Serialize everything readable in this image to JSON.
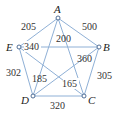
{
  "graph": {
    "nodes": [
      {
        "id": "A",
        "label": "A",
        "x": 58,
        "y": 18
      },
      {
        "id": "B",
        "label": "B",
        "x": 99,
        "y": 47
      },
      {
        "id": "C",
        "label": "C",
        "x": 84,
        "y": 96
      },
      {
        "id": "D",
        "label": "D",
        "x": 33,
        "y": 96
      },
      {
        "id": "E",
        "label": "E",
        "x": 19,
        "y": 47
      }
    ],
    "edges": [
      {
        "from": "A",
        "to": "E",
        "weight": "205"
      },
      {
        "from": "A",
        "to": "B",
        "weight": "500"
      },
      {
        "from": "A",
        "to": "C",
        "weight": "200"
      },
      {
        "from": "A",
        "to": "D",
        "weight": "185"
      },
      {
        "from": "E",
        "to": "B",
        "weight": "340"
      },
      {
        "from": "B",
        "to": "D",
        "weight": "360"
      },
      {
        "from": "B",
        "to": "C",
        "weight": "305"
      },
      {
        "from": "E",
        "to": "D",
        "weight": "302"
      },
      {
        "from": "E",
        "to": "C",
        "weight": "165"
      },
      {
        "from": "D",
        "to": "C",
        "weight": "320"
      }
    ]
  },
  "colors": {
    "edge": "#8fb0d6",
    "node_stroke": "#3e5f8a",
    "text": "#333333"
  }
}
